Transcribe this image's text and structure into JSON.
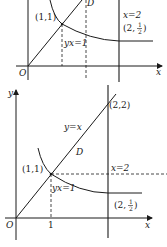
{
  "figures": [
    {
      "id": "top",
      "labels": {
        "point_11": "(1,1)",
        "curve": "yx=1",
        "region": "D",
        "vline": "x=2",
        "point_2half_prefix": "(2,",
        "half_num": "1",
        "half_den": "2",
        "point_2half_suffix": ")",
        "origin": "O",
        "x_axis": "x"
      }
    },
    {
      "id": "bottom",
      "labels": {
        "y_axis": "y",
        "point_22": "(2,2)",
        "line": "y=x",
        "region": "D",
        "point_11": "(1,1)",
        "vline": "x=2",
        "curve": "yx=1",
        "point_2half_prefix": "(2,",
        "half_num": "1",
        "half_den": "2",
        "point_2half_suffix": ")",
        "origin": "O",
        "tick_1": "1",
        "x_axis": "x"
      }
    }
  ],
  "colors": {
    "ink": "#1a1a1a",
    "background": "#ffffff"
  }
}
